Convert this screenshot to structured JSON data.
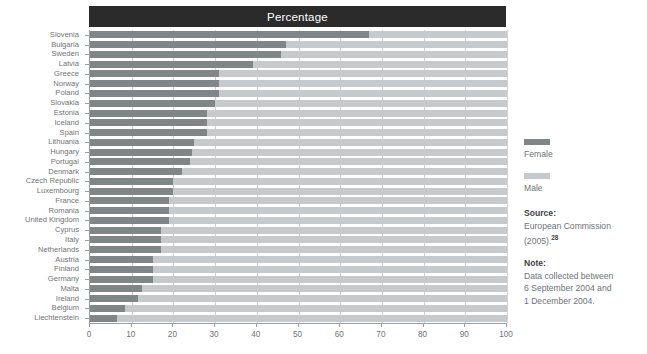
{
  "chart_data": {
    "type": "bar",
    "orientation": "horizontal",
    "stacked": true,
    "title": "Percentage",
    "xlabel": "",
    "ylabel": "",
    "xlim": [
      0,
      100
    ],
    "xticks": [
      0,
      10,
      20,
      30,
      40,
      50,
      60,
      70,
      80,
      90,
      100
    ],
    "grid": true,
    "legend_position": "right",
    "legend": [
      "Female",
      "Male"
    ],
    "colors": {
      "female": "#808588",
      "male": "#c6cacc",
      "title_band": "#2b2b2b"
    },
    "categories": [
      "Slovenia",
      "Bulgaria",
      "Sweden",
      "Latvia",
      "Greece",
      "Norway",
      "Poland",
      "Slovakia",
      "Estonia",
      "Iceland",
      "Spain",
      "Lithuania",
      "Hungary",
      "Portugal",
      "Denmark",
      "Czech Republic",
      "Luxembourg",
      "France",
      "Romania",
      "United Kingdom",
      "Cyprus",
      "Italy",
      "Netherlands",
      "Austria",
      "Finland",
      "Germany",
      "Malta",
      "Ireland",
      "Belgium",
      "Liechtenstein"
    ],
    "series": [
      {
        "name": "Female",
        "values": [
          67,
          47,
          45.7,
          39,
          31,
          31,
          31,
          30,
          28,
          28,
          28,
          25,
          24.5,
          24,
          22,
          20,
          20,
          19,
          19,
          19,
          17,
          17,
          17,
          15,
          15,
          15,
          12.5,
          11.5,
          8.5,
          6.5
        ]
      },
      {
        "name": "Male",
        "values": [
          33,
          53,
          54.3,
          61,
          69,
          69,
          69,
          70,
          72,
          72,
          72,
          75,
          75.5,
          76,
          78,
          80,
          80,
          81,
          81,
          81,
          83,
          83,
          83,
          85,
          85,
          85,
          87.5,
          88.5,
          91.5,
          93.5
        ]
      }
    ]
  },
  "legend": {
    "female_label": "Female",
    "male_label": "Male"
  },
  "notes": {
    "source_heading": "Source:",
    "source_lines": [
      "European Commission",
      "(2005)."
    ],
    "source_ref": "28",
    "note_heading": "Note:",
    "note_lines": [
      "Data collected between",
      "6 September 2004 and",
      "1 December 2004."
    ]
  }
}
